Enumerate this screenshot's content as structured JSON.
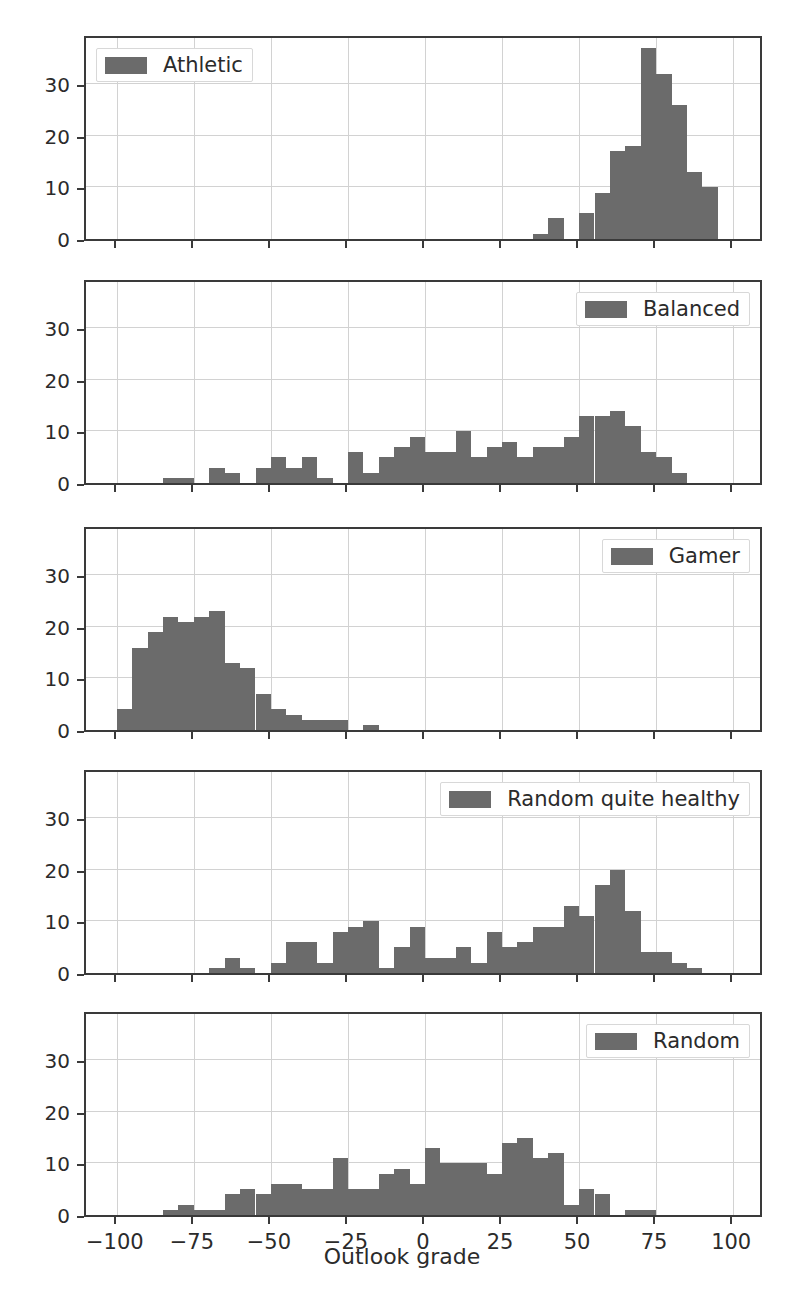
{
  "figure": {
    "xlabel": "Outlook grade",
    "bar_color": "#6b6b6b",
    "grid_color": "#d2d2d2",
    "axis_color": "#3a3a3a",
    "background": "#ffffff"
  },
  "axis": {
    "xticks": [
      -100,
      -75,
      -50,
      -25,
      0,
      25,
      50,
      75,
      100
    ],
    "xtick_labels": [
      "−100",
      "−75",
      "−50",
      "−25",
      "0",
      "25",
      "50",
      "75",
      "100"
    ],
    "yticks": [
      0,
      10,
      20,
      30
    ],
    "ytick_labels": [
      "0",
      "10",
      "20",
      "30"
    ],
    "xlim": [
      -110,
      110
    ],
    "ylim": [
      0,
      39
    ]
  },
  "chart_data": {
    "type": "bar",
    "title": "",
    "xlabel": "Outlook grade",
    "ylabel": "",
    "xlim": [
      -110,
      110
    ],
    "ylim": [
      0,
      39
    ],
    "grid": true,
    "legend_position": "inside-top",
    "bin_width": 5,
    "panels": [
      {
        "name": "athletic",
        "legend_label": "Athletic",
        "legend_side": "left",
        "bins": [
          25,
          30,
          35,
          40,
          45,
          50,
          55,
          60,
          65,
          70,
          75,
          80,
          85,
          90
        ],
        "values": [
          0,
          0,
          1,
          4,
          0,
          5,
          9,
          17,
          18,
          37,
          32,
          26,
          13,
          10
        ]
      },
      {
        "name": "balanced",
        "legend_label": "Balanced",
        "legend_side": "right",
        "bins": [
          -85,
          -80,
          -75,
          -70,
          -65,
          -60,
          -55,
          -50,
          -45,
          -40,
          -35,
          -30,
          -25,
          -20,
          -15,
          -10,
          -5,
          0,
          5,
          10,
          15,
          20,
          25,
          30,
          35,
          40,
          45,
          50,
          55,
          60,
          65,
          70,
          75
        ],
        "values": [
          1,
          1,
          0,
          3,
          2,
          0,
          3,
          5,
          3,
          5,
          1,
          0,
          6,
          2,
          5,
          7,
          9,
          6,
          6,
          10,
          5,
          7,
          8,
          5,
          7,
          7,
          9,
          13,
          13,
          14,
          11,
          6,
          5
        ],
        "values_extra": [
          2
        ]
      },
      {
        "name": "gamer",
        "legend_label": "Gamer",
        "legend_side": "right",
        "bins": [
          -100,
          -95,
          -90,
          -85,
          -80,
          -75,
          -70,
          -65,
          -60,
          -55,
          -50,
          -45,
          -40,
          -35,
          -30,
          -25,
          -20
        ],
        "values": [
          4,
          16,
          19,
          22,
          21,
          22,
          23,
          13,
          12,
          7,
          4,
          3,
          2,
          2,
          2,
          0,
          1
        ]
      },
      {
        "name": "random_quite_healthy",
        "legend_label": "Random quite healthy",
        "legend_side": "right",
        "bins": [
          -70,
          -65,
          -60,
          -55,
          -50,
          -45,
          -40,
          -35,
          -30,
          -25,
          -20,
          -15,
          -10,
          -5,
          0,
          5,
          10,
          15,
          20,
          25,
          30,
          35,
          40,
          45,
          50,
          55,
          60,
          65,
          70,
          75,
          80,
          85
        ],
        "values": [
          1,
          3,
          1,
          0,
          2,
          6,
          6,
          2,
          8,
          9,
          10,
          1,
          5,
          9,
          3,
          3,
          5,
          2,
          8,
          5,
          6,
          9,
          9,
          13,
          11,
          17,
          20,
          12,
          4,
          4,
          2,
          1
        ]
      },
      {
        "name": "random",
        "legend_label": "Random",
        "legend_side": "right",
        "bins": [
          -85,
          -80,
          -75,
          -70,
          -65,
          -60,
          -55,
          -50,
          -45,
          -40,
          -35,
          -30,
          -25,
          -20,
          -15,
          -10,
          -5,
          0,
          5,
          10,
          15,
          20,
          25,
          30,
          35,
          40,
          45,
          50,
          55,
          60,
          65,
          70,
          75,
          80
        ],
        "values": [
          1,
          2,
          1,
          1,
          4,
          5,
          4,
          6,
          6,
          5,
          5,
          11,
          5,
          5,
          8,
          9,
          6,
          13,
          10,
          10,
          10,
          8,
          14,
          15,
          11,
          12,
          2,
          5,
          4,
          0,
          1,
          1,
          0,
          0
        ]
      }
    ]
  }
}
